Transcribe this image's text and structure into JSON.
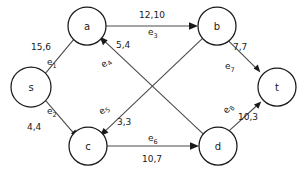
{
  "diagram": {
    "colors": {
      "background": "#ffffff",
      "node_stroke": "#1a1a1a",
      "node_fill": "#ffffff",
      "edge_stroke": "#4a4a4a",
      "text": "#1a1a1a"
    },
    "nodes": [
      {
        "id": "s",
        "label": "s",
        "cx": 31,
        "cy": 87,
        "r": 20
      },
      {
        "id": "a",
        "label": "a",
        "cx": 87,
        "cy": 26,
        "r": 19
      },
      {
        "id": "b",
        "label": "b",
        "cx": 217,
        "cy": 26,
        "r": 19
      },
      {
        "id": "c",
        "label": "c",
        "cx": 88,
        "cy": 146,
        "r": 19
      },
      {
        "id": "d",
        "label": "d",
        "cx": 218,
        "cy": 146,
        "r": 19
      },
      {
        "id": "t",
        "label": "t",
        "cx": 277,
        "cy": 87,
        "r": 19
      }
    ],
    "edges": [
      {
        "id": "e1",
        "name": "e",
        "sub": "1",
        "from": "s",
        "to": "a",
        "capacity": 15,
        "flow": 6,
        "value_label": "15,6",
        "cap_x": 31,
        "cap_y": 50,
        "cap_anchor": "start",
        "id_x": 47,
        "id_y": 65,
        "id_anchor": "start"
      },
      {
        "id": "e2",
        "name": "e",
        "sub": "2",
        "from": "s",
        "to": "c",
        "capacity": 4,
        "flow": 4,
        "value_label": "4,4",
        "cap_x": 27,
        "cap_y": 130,
        "cap_anchor": "start",
        "id_x": 47,
        "id_y": 114,
        "id_anchor": "start"
      },
      {
        "id": "e3",
        "name": "e",
        "sub": "3",
        "from": "a",
        "to": "b",
        "capacity": 12,
        "flow": 10,
        "value_label": "12,10",
        "cap_x": 152,
        "cap_y": 18,
        "cap_anchor": "middle",
        "id_x": 152,
        "id_y": 35,
        "id_anchor": "middle"
      },
      {
        "id": "e4",
        "name": "e",
        "sub": "4",
        "from": "d",
        "to": "a",
        "capacity": 5,
        "flow": 4,
        "value_label": "5,4",
        "cap_x": 116,
        "cap_y": 48,
        "cap_anchor": "start",
        "id_x": 106,
        "id_y": 68,
        "id_anchor": "start"
      },
      {
        "id": "e5",
        "name": "e",
        "sub": "5",
        "from": "b",
        "to": "c",
        "capacity": 3,
        "flow": 3,
        "value_label": "3,3",
        "cap_x": 117,
        "cap_y": 124,
        "cap_anchor": "start",
        "id_x": 104,
        "id_y": 113,
        "id_anchor": "start"
      },
      {
        "id": "e6",
        "name": "e",
        "sub": "6",
        "from": "c",
        "to": "d",
        "capacity": 10,
        "flow": 7,
        "value_label": "10,7",
        "cap_x": 152,
        "cap_y": 160,
        "cap_anchor": "middle",
        "id_x": 152,
        "id_y": 140,
        "id_anchor": "middle"
      },
      {
        "id": "e7",
        "name": "e",
        "sub": "7",
        "from": "b",
        "to": "t",
        "capacity": 7,
        "flow": 7,
        "value_label": "7,7",
        "cap_x": 233,
        "cap_y": 50,
        "cap_anchor": "start",
        "id_x": 227,
        "id_y": 68,
        "id_anchor": "start"
      },
      {
        "id": "e8",
        "name": "e",
        "sub": "8",
        "from": "d",
        "to": "t",
        "capacity": 10,
        "flow": 3,
        "value_label": "10,3",
        "cap_x": 238,
        "cap_y": 119,
        "cap_anchor": "start",
        "id_x": 228,
        "id_y": 112,
        "id_anchor": "start",
        "id_rotate": -52
      }
    ]
  }
}
